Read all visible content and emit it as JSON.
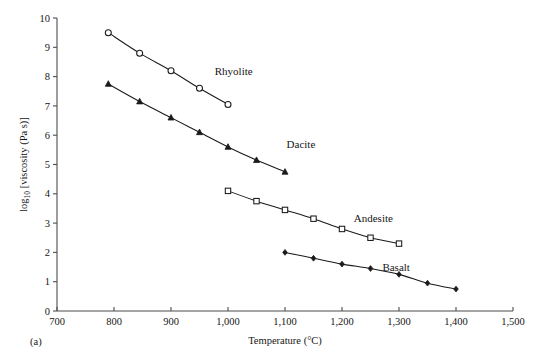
{
  "figure": {
    "panel_label": "(a)",
    "width": 558,
    "height": 363
  },
  "chart_data": {
    "type": "line",
    "title": "",
    "xlabel": "Temperature (°C)",
    "ylabel": "log10 [viscosity (Pa s)]",
    "ylabel_base": "log",
    "ylabel_sub": "10",
    "ylabel_rest": " [viscosity (Pa s)]",
    "xlim": [
      700,
      1500
    ],
    "ylim": [
      0,
      10
    ],
    "grid": false,
    "legend": "inline-labels",
    "xticks": [
      700,
      800,
      900,
      1000,
      1100,
      1200,
      1300,
      1400,
      1500
    ],
    "xtick_labels": [
      "700",
      "800",
      "900",
      "1,000",
      "1,100",
      "1,200",
      "1,300",
      "1,400",
      "1,500"
    ],
    "yticks": [
      0,
      1,
      2,
      3,
      4,
      5,
      6,
      7,
      8,
      9,
      10
    ],
    "ytick_labels": [
      "0",
      "1",
      "2",
      "3",
      "4",
      "5",
      "6",
      "7",
      "8",
      "9",
      "10"
    ],
    "series": [
      {
        "name": "Rhyolite",
        "marker": "open-circle",
        "label_x": 1010,
        "label_y": 8.05,
        "x": [
          790,
          845,
          900,
          950,
          1000
        ],
        "values": [
          9.5,
          8.8,
          8.2,
          7.6,
          7.05
        ]
      },
      {
        "name": "Dacite",
        "marker": "filled-triangle",
        "label_x": 1128,
        "label_y": 5.55,
        "x": [
          790,
          845,
          900,
          950,
          1000,
          1050,
          1100
        ],
        "values": [
          7.75,
          7.15,
          6.6,
          6.1,
          5.6,
          5.15,
          4.75
        ]
      },
      {
        "name": "Andesite",
        "marker": "open-square",
        "label_x": 1255,
        "label_y": 3.05,
        "x": [
          1000,
          1050,
          1100,
          1150,
          1200,
          1250,
          1300
        ],
        "values": [
          4.1,
          3.75,
          3.45,
          3.15,
          2.8,
          2.5,
          2.3
        ]
      },
      {
        "name": "Basalt",
        "marker": "small-diamond",
        "label_x": 1295,
        "label_y": 1.35,
        "x": [
          1100,
          1150,
          1200,
          1250,
          1300,
          1350,
          1400
        ],
        "values": [
          2.0,
          1.8,
          1.6,
          1.45,
          1.25,
          0.95,
          0.75
        ]
      }
    ]
  },
  "colors": {
    "axis": "#4d4d4d",
    "data": "#1a1a1a",
    "background": "#ffffff",
    "text": "#161616"
  }
}
